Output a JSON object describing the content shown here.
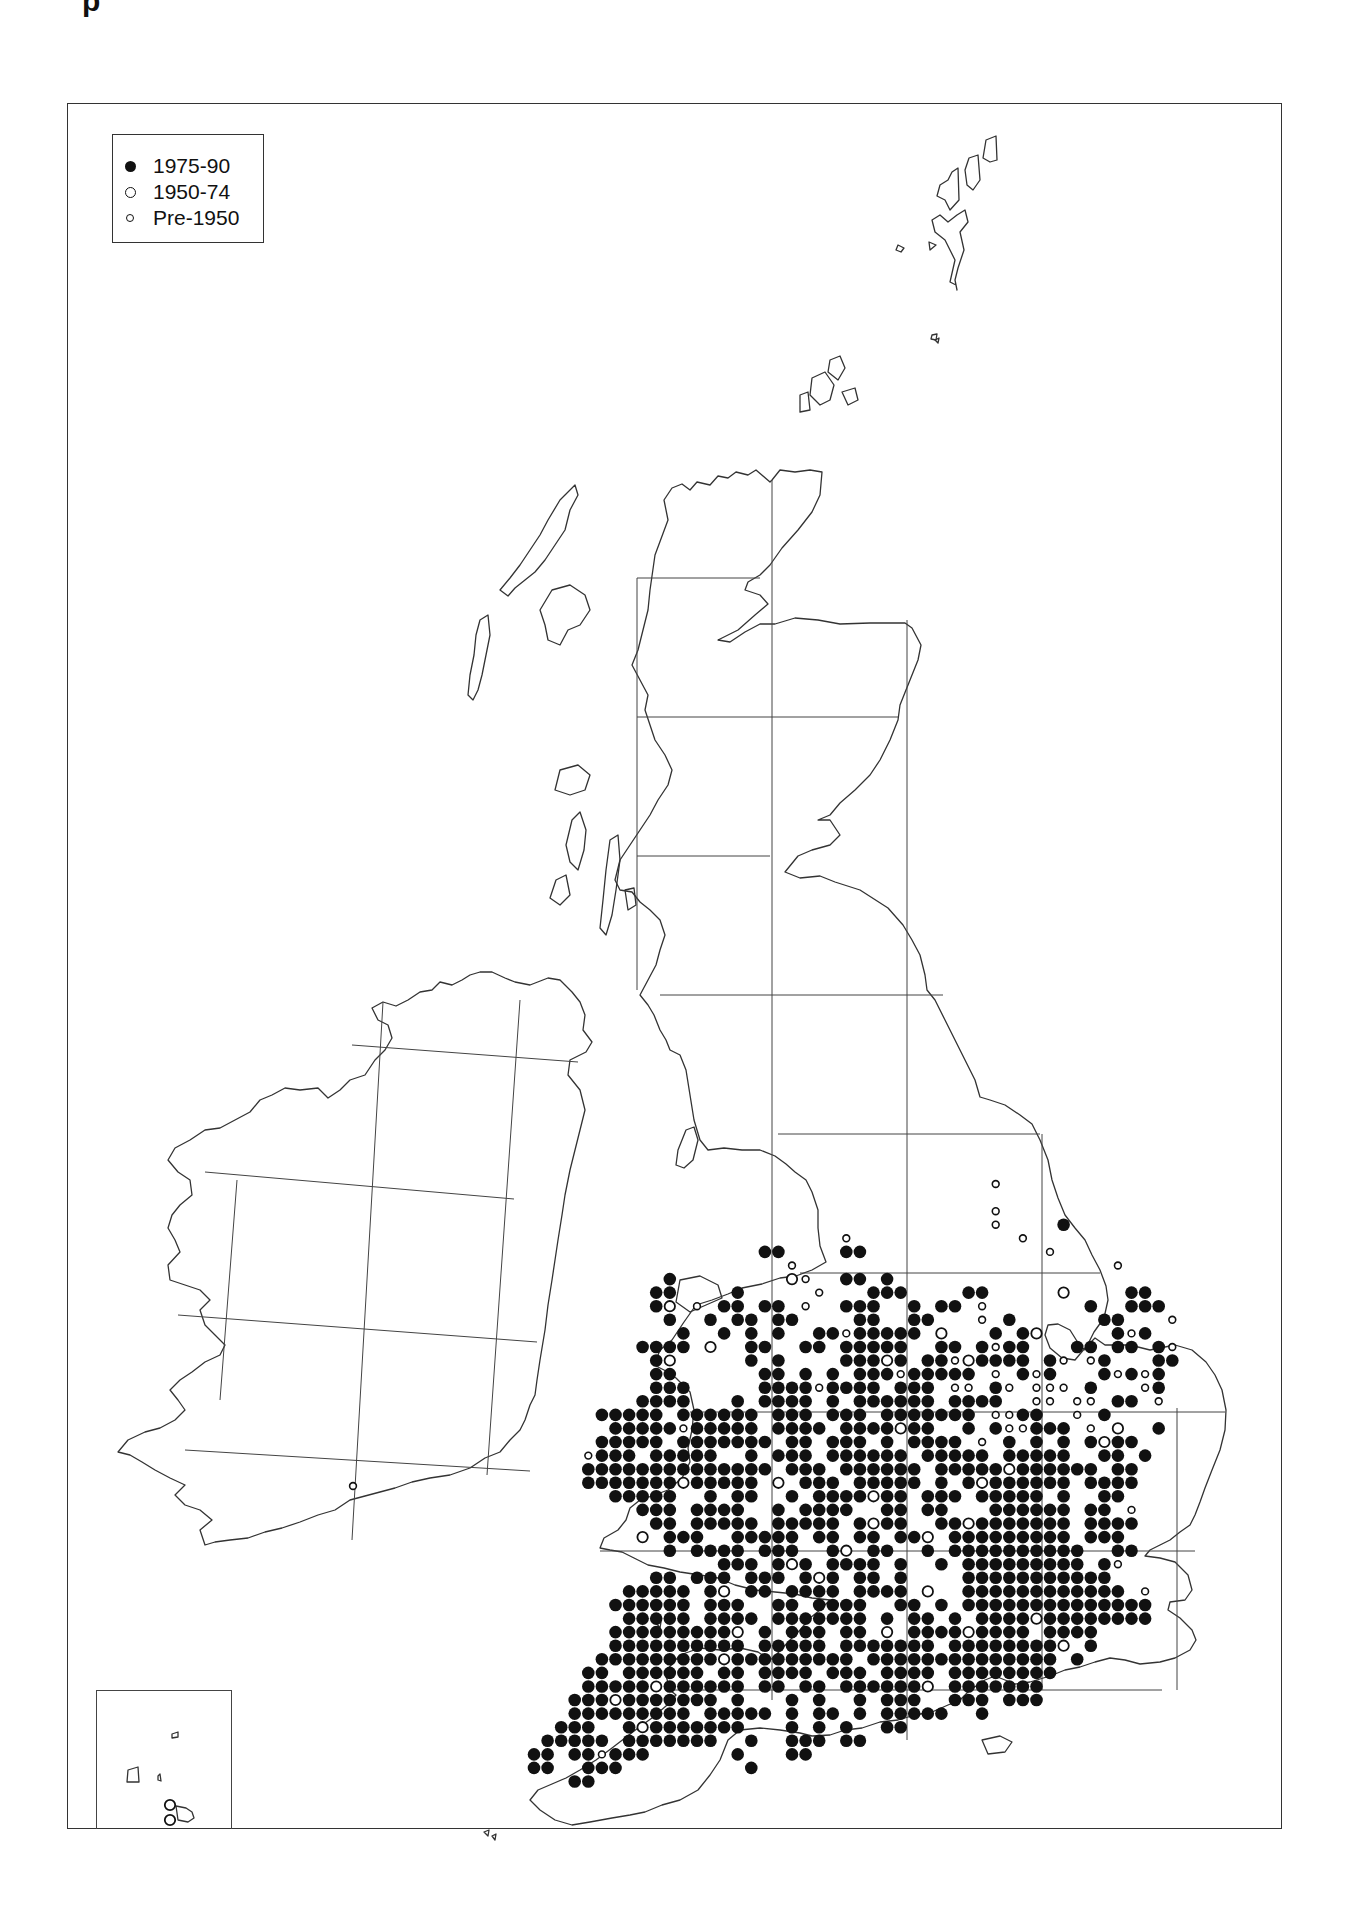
{
  "title_fragment": "p",
  "legend": {
    "items": [
      {
        "symbol": "filled-circle",
        "label": "1975-90"
      },
      {
        "symbol": "open-circle",
        "label": "1950-74"
      },
      {
        "symbol": "small-open-circle",
        "label": "Pre-1950"
      }
    ]
  },
  "colors": {
    "ink": "#111111",
    "coast": "#333333",
    "grid": "#444444",
    "paper": "#ffffff"
  },
  "map": {
    "region": "Britain and Ireland 10-km square distribution map",
    "frame": {
      "x": 67,
      "y": 103,
      "w": 1215,
      "h": 1726
    },
    "inset": {
      "label": "Channel Islands",
      "x": 96,
      "y": 1690,
      "w": 136,
      "h": 139
    }
  },
  "chart_data": {
    "type": "scatter",
    "title": "",
    "legend_position": "top-left",
    "grid": true,
    "symbols": {
      "#": "1975-90",
      "O": "1950-74",
      "o": "Pre-1950"
    },
    "dot_grid": {
      "origin_x": 534,
      "origin_y": 1184,
      "pitch": 13.58,
      "rows": [
        "..................................o..............",
        "...............................................",
        "..................................o..............",
        "..................................o....#.........",
        ".......................o............o............",
        ".................##....##.............o..........",
        "...................o.......................o.....",
        "..........#........Oo..##.#......................",
        ".........##....#.....o...###....##.....O....##..",
        ".........#O.o.##.##.o..###..#.##.o.......#..###",
        "..........#..#.##.##....##..##...o.#......##...o",
        "...........#..#.#.#..##o#####.O...#.#O.....#o#..",
        "........####.O..##..##.#####..##.#o##...##.##.#o",
        ".........#O.....#.#....###O#.##oO####.#o.o#...##",
        ".........##......##.#.#.###o#####.o.#o#...#o#o#",
        ".........###.....####o####.###.oo.#o.ooo.#...o#",
        "........####...#.####.#.######.####..oo.oo.##.o",
        ".....#####.######.###.###.#######.oo##..o.#....",
        "......#####o#####.####.####O##..#.#oo###.o.O..#",
        ".....#####.#######.##.###.#.####.o.#.#.#.#O##.",
        "....o###.#####..#.###.######.#####.#####..##.#.",
        "....##############.###.######.#####O######.##.",
        "....#######O#####.O.###.#####.#.#O######.####.",
        "......#####..#.##..#.####O##.###.#####.#..##.",
        "........###.####..#.####..##.##...######.##.o",
        ".........##.#####.#####.#O##..##O#######.####",
        "........O.###..#####.##.##.##O.#########.###.",
        "..........#.####.###..#O.##..#.##########..##",
        "..............###.#O#.####.#..#.#########.#o",
        ".........##.###.###.#O#.##.#....###########.",
        ".......#####.#O.##.####.####.O..############.o",
        "......######.###..##.####..##.#.##############",
        ".......#####.####.#######.#.##.#.####O########",
        "......#########O.#.###.##.O.####O####.####..",
        "......##########.#####.#######.########O.#",
        ".....#########O#########.##############.#",
        "....##.######.##.####.###.####.########..",
        "....#####O######.##.##.######O.#######.",
        "...###O#######.#...#.#..#.###..###.###",
        "...#########.#####.#.##.#.#####..#",
        "..###..#O#######...#.#.#..##.",
        ".#####.#######..#..###.##.",
        "##.##o###......#...##",
        "##..###.........#",
        "...##"
      ],
      "outliers": [
        {
          "x": 353,
          "y": 1486,
          "symbol": "o",
          "note": "Ireland, south coast"
        },
        {
          "x": 170,
          "y": 1805,
          "symbol": "O",
          "note": "Channel Islands inset"
        },
        {
          "x": 170,
          "y": 1820,
          "symbol": "O",
          "note": "Channel Islands inset"
        }
      ]
    },
    "grid_lines_100km": {
      "britain_vertical_x": [
        637,
        772,
        907,
        1042,
        1177
      ],
      "britain_horizontal_y": [
        578,
        717,
        856,
        995,
        1134,
        1273,
        1412,
        1551,
        1690
      ]
    }
  }
}
